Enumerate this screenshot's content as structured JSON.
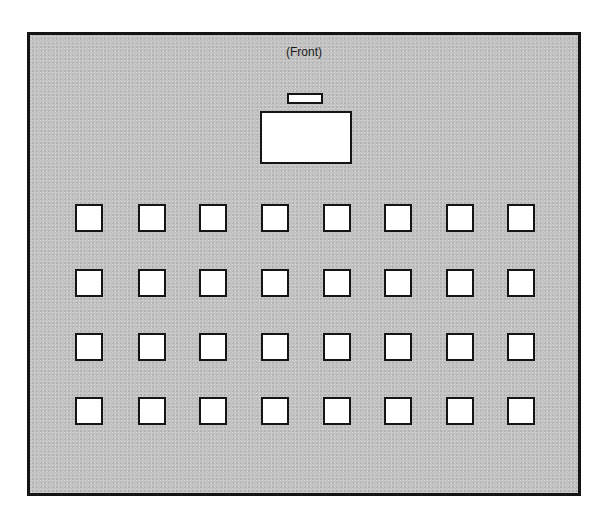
{
  "diagram": {
    "type": "classroom-seating-layout",
    "front_label": "(Front)",
    "colors": {
      "floor": "#c3c3c3",
      "border": "#141414",
      "desk": "#ffffff"
    },
    "lectern": {
      "x": 287,
      "y": 93,
      "w": 36,
      "h": 11
    },
    "teacher_desk": {
      "x": 260,
      "y": 111,
      "w": 92,
      "h": 53
    },
    "student_desks": {
      "rows": 4,
      "columns": 8,
      "col_x": [
        75,
        138,
        199,
        261,
        323,
        384,
        446,
        507
      ],
      "row_y": [
        204,
        269,
        333,
        397
      ],
      "size": 28
    }
  }
}
